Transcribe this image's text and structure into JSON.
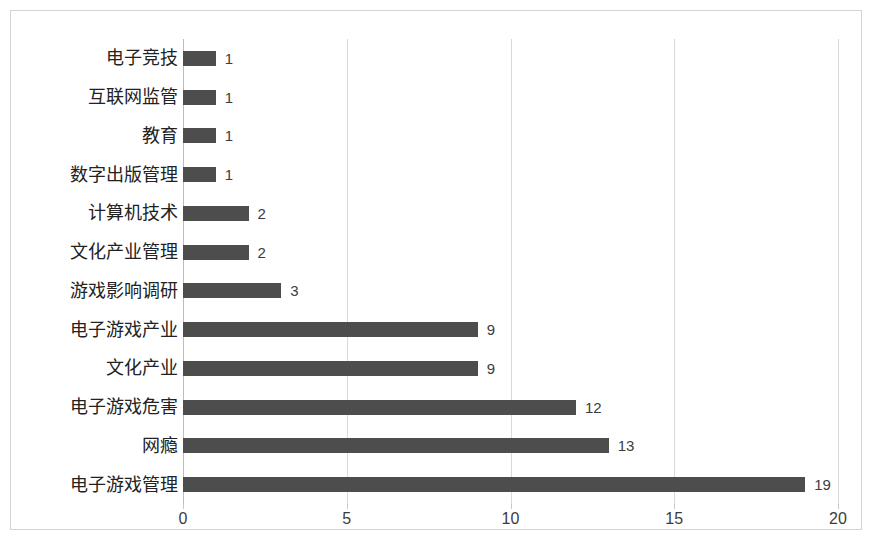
{
  "chart_data": {
    "type": "bar",
    "orientation": "horizontal",
    "title": "",
    "subtitle": "",
    "xlabel": "",
    "ylabel": "",
    "xlim": [
      0,
      20
    ],
    "x_ticks": [
      "0",
      "5",
      "10",
      "15",
      "20"
    ],
    "grid": true,
    "legend": null,
    "bar_color": "#4d4d4d",
    "show_data_labels": true,
    "categories": [
      "电子竞技",
      "互联网监管",
      "教育",
      "数字出版管理",
      "计算机技术",
      "文化产业管理",
      "游戏影响调研",
      "电子游戏产业",
      "文化产业",
      "电子游戏危害",
      "网瘾",
      "电子游戏管理"
    ],
    "values": [
      1,
      1,
      1,
      1,
      2,
      2,
      3,
      9,
      9,
      12,
      13,
      19
    ],
    "value_labels": [
      "1",
      "1",
      "1",
      "1",
      "2",
      "2",
      "3",
      "9",
      "9",
      "12",
      "13",
      "19"
    ]
  }
}
